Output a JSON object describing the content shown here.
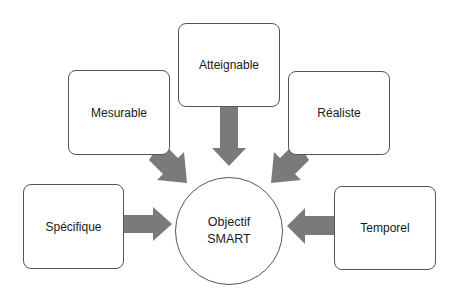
{
  "diagram": {
    "center": {
      "line1": "Objectif",
      "line2": "SMART"
    },
    "criteria": [
      {
        "key": "specifique",
        "label": "Spécifique"
      },
      {
        "key": "mesurable",
        "label": "Mesurable"
      },
      {
        "key": "atteignable",
        "label": "Atteignable"
      },
      {
        "key": "realiste",
        "label": "Réaliste"
      },
      {
        "key": "temporel",
        "label": "Temporel"
      }
    ],
    "colors": {
      "arrow": "#7a7a7a",
      "border": "#555555",
      "background": "#ffffff"
    }
  }
}
